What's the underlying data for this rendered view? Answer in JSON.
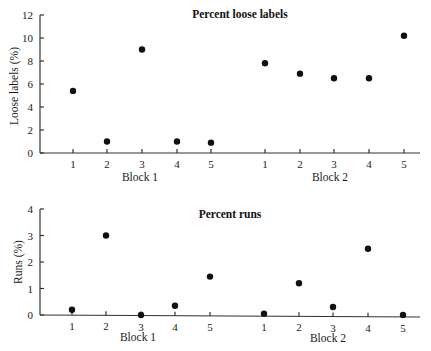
{
  "chart_data": [
    {
      "type": "scatter",
      "title": "Percent loose labels",
      "ylabel": "Loose labels (%)",
      "xlabel": "",
      "ylim": [
        0,
        12
      ],
      "yticks": [
        0,
        2,
        4,
        6,
        8,
        10,
        12
      ],
      "grid": false,
      "legend": null,
      "groups": [
        {
          "name": "Block 1",
          "x": [
            1,
            2,
            3,
            4,
            5
          ],
          "values": [
            5.4,
            1.0,
            9.0,
            1.0,
            0.9
          ]
        },
        {
          "name": "Block 2",
          "x": [
            1,
            2,
            3,
            4,
            5
          ],
          "values": [
            7.8,
            6.9,
            6.5,
            6.5,
            10.2
          ]
        }
      ]
    },
    {
      "type": "scatter",
      "title": "Percent runs",
      "ylabel": "Runs (%)",
      "xlabel": "",
      "ylim": [
        0,
        4
      ],
      "yticks": [
        0,
        1,
        2,
        3,
        4
      ],
      "grid": false,
      "legend": null,
      "groups": [
        {
          "name": "Block 1",
          "x": [
            1,
            2,
            3,
            4,
            5
          ],
          "values": [
            0.2,
            3.0,
            0.0,
            0.35,
            1.45
          ]
        },
        {
          "name": "Block 2",
          "x": [
            1,
            2,
            3,
            4,
            5
          ],
          "values": [
            0.05,
            1.2,
            0.3,
            2.5,
            0.0
          ]
        }
      ]
    }
  ],
  "top": {
    "title": "Percent loose labels",
    "ylabel": "Loose labels (%)",
    "yticks": [
      "0",
      "2",
      "4",
      "6",
      "8",
      "10",
      "12"
    ],
    "xticks": [
      "1",
      "2",
      "3",
      "4",
      "5"
    ],
    "block1": "Block 1",
    "block2": "Block 2"
  },
  "bottom": {
    "title": "Percent runs",
    "ylabel": "Runs (%)",
    "yticks": [
      "0",
      "1",
      "2",
      "3",
      "4"
    ],
    "xticks": [
      "1",
      "2",
      "3",
      "4",
      "5"
    ],
    "block1": "Block 1",
    "block2": "Block 2"
  }
}
